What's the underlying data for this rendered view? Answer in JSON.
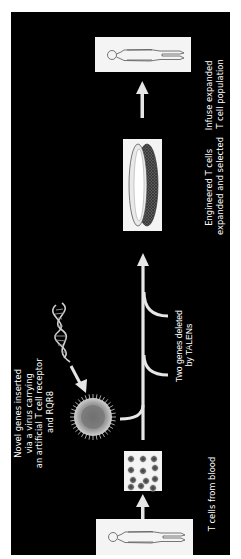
{
  "diagram": {
    "orientation": "rotated-90-ccw",
    "colors": {
      "background": "#000000",
      "foreground": "#ffffff",
      "box_fill": "#f4f4f4",
      "arrow": "#e6e6e6"
    },
    "steps": [
      {
        "id": "blood",
        "label": "T cells from blood",
        "icon": "person-icon"
      },
      {
        "id": "cells",
        "label": "",
        "icon": "cell-sample-icon"
      },
      {
        "id": "virus",
        "label_lines": [
          "Novel genes inserted",
          "via a virus carrying",
          "an artificial T cell receptor",
          "and RQR8"
        ],
        "icons": [
          "dna-icon",
          "virus-icon"
        ]
      },
      {
        "id": "talens",
        "label_lines": [
          "Two genes deleted",
          "by TALENs"
        ]
      },
      {
        "id": "culture",
        "label_lines": [
          "Engineered T cells",
          "expanded and selected"
        ],
        "icon": "culture-dish-icon"
      },
      {
        "id": "infuse",
        "label_lines": [
          "Infuse expanded",
          "T cell population"
        ],
        "icon": "person-icon"
      }
    ]
  }
}
